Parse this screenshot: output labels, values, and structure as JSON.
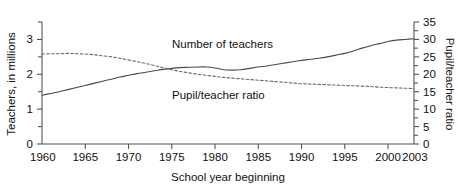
{
  "chart_data": {
    "type": "line",
    "title": "",
    "xlabel": "School year beginning",
    "ylabel": "Teachers, in millions",
    "y2label": "Pupil/teacher ratio",
    "grid": false,
    "legend_position": "inline-annotations",
    "xlim": [
      1960,
      2003
    ],
    "ylim": [
      0,
      3.5
    ],
    "y2lim": [
      0,
      35
    ],
    "x_ticks": [
      1960,
      1965,
      1970,
      1975,
      1980,
      1985,
      1990,
      1995,
      2000,
      2003
    ],
    "x_tick_labels": [
      "1960",
      "1965",
      "1970",
      "1975",
      "1980",
      "1985",
      "1990",
      "1995",
      "2000",
      "2003"
    ],
    "y_ticks": [
      0,
      0.5,
      1,
      1.5,
      2,
      2.5,
      3,
      3.5
    ],
    "y_tick_labels": [
      "0",
      "",
      "1",
      "",
      "2",
      "",
      "3",
      ""
    ],
    "y2_ticks": [
      0,
      2.5,
      5,
      7.5,
      10,
      12.5,
      15,
      17.5,
      20,
      22.5,
      25,
      27.5,
      30,
      32.5,
      35
    ],
    "y2_tick_labels": [
      "0",
      "",
      "5",
      "",
      "10",
      "",
      "15",
      "",
      "20",
      "",
      "25",
      "",
      "30",
      "",
      "35"
    ],
    "series": [
      {
        "name": "Number of teachers",
        "axis": "left",
        "style": "solid",
        "annotation": "Number of teachers",
        "x": [
          1960,
          1961,
          1962,
          1963,
          1964,
          1965,
          1966,
          1967,
          1968,
          1969,
          1970,
          1971,
          1972,
          1973,
          1974,
          1975,
          1976,
          1977,
          1978,
          1979,
          1980,
          1981,
          1982,
          1983,
          1984,
          1985,
          1986,
          1987,
          1988,
          1989,
          1990,
          1991,
          1992,
          1993,
          1994,
          1995,
          1996,
          1997,
          1998,
          1999,
          2000,
          2001,
          2002,
          2003
        ],
        "values": [
          1.4,
          1.45,
          1.5,
          1.56,
          1.62,
          1.68,
          1.74,
          1.8,
          1.86,
          1.92,
          1.97,
          2.02,
          2.06,
          2.1,
          2.14,
          2.17,
          2.19,
          2.2,
          2.21,
          2.21,
          2.18,
          2.13,
          2.12,
          2.13,
          2.17,
          2.21,
          2.24,
          2.28,
          2.32,
          2.36,
          2.4,
          2.43,
          2.46,
          2.5,
          2.55,
          2.6,
          2.67,
          2.75,
          2.82,
          2.88,
          2.94,
          2.98,
          3.0,
          3.02
        ]
      },
      {
        "name": "Pupil/teacher ratio",
        "axis": "right",
        "style": "dashed",
        "annotation": "Pupil/teacher ratio",
        "x": [
          1960,
          1961,
          1962,
          1963,
          1964,
          1965,
          1966,
          1967,
          1968,
          1969,
          1970,
          1971,
          1972,
          1973,
          1974,
          1975,
          1976,
          1977,
          1978,
          1979,
          1980,
          1981,
          1982,
          1983,
          1984,
          1985,
          1986,
          1987,
          1988,
          1989,
          1990,
          1991,
          1992,
          1993,
          1994,
          1995,
          1996,
          1997,
          1998,
          1999,
          2000,
          2001,
          2002,
          2003
        ],
        "values": [
          25.8,
          25.9,
          25.9,
          26.0,
          25.9,
          25.8,
          25.6,
          25.3,
          25.0,
          24.6,
          24.1,
          23.6,
          23.1,
          22.5,
          21.9,
          21.3,
          20.8,
          20.4,
          20.0,
          19.7,
          19.4,
          19.1,
          18.9,
          18.7,
          18.5,
          18.3,
          18.1,
          17.9,
          17.7,
          17.5,
          17.3,
          17.2,
          17.1,
          17.0,
          16.9,
          16.8,
          16.7,
          16.6,
          16.5,
          16.3,
          16.2,
          16.1,
          16.0,
          15.9
        ]
      }
    ]
  },
  "axes": {
    "left_title": "Teachers, in millions",
    "right_title": "Pupil/teacher ratio",
    "bottom_title": "School year beginning"
  },
  "annotations": {
    "teachers": "Number of teachers",
    "ratio": "Pupil/teacher ratio"
  },
  "left_tick_labels": [
    {
      "value": "3",
      "y": 3
    },
    {
      "value": "2",
      "y": 2
    },
    {
      "value": "1",
      "y": 1
    },
    {
      "value": "0",
      "y": 0
    }
  ],
  "right_tick_labels": [
    {
      "value": "35",
      "y": 35
    },
    {
      "value": "30",
      "y": 30
    },
    {
      "value": "25",
      "y": 25
    },
    {
      "value": "20",
      "y": 20
    },
    {
      "value": "15",
      "y": 15
    },
    {
      "value": "10",
      "y": 10
    },
    {
      "value": "5",
      "y": 5
    },
    {
      "value": "0",
      "y": 0
    }
  ],
  "x_tick_labels": [
    "1960",
    "1965",
    "1970",
    "1975",
    "1980",
    "1985",
    "1990",
    "1995",
    "2000",
    "2003"
  ],
  "colors": {
    "axis": "#555555",
    "teachers_line": "#4a4a4a",
    "ratio_line": "#6a6a6a",
    "text": "#111111",
    "background": "#ffffff"
  }
}
